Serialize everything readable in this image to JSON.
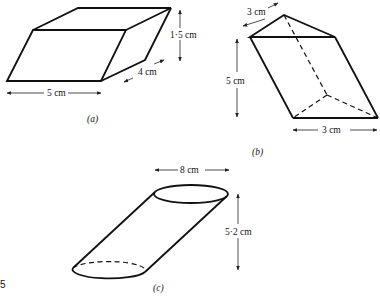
{
  "figures": {
    "a": {
      "caption": "(a)",
      "shape": "oblique-parallelepiped",
      "labels": {
        "width": "5 cm",
        "depth": "4 cm",
        "height": "1·5 cm"
      }
    },
    "b": {
      "caption": "(b)",
      "shape": "oblique-triangular-prism",
      "labels": {
        "top_edge": "3 cm",
        "height": "5 cm",
        "base": "3 cm"
      }
    },
    "c": {
      "caption": "(c)",
      "shape": "oblique-cylinder",
      "labels": {
        "diameter": "8 cm",
        "height": "5·2 cm"
      }
    }
  },
  "page_number": "5",
  "colors": {
    "line": "#111111",
    "background": "#ffffff"
  }
}
